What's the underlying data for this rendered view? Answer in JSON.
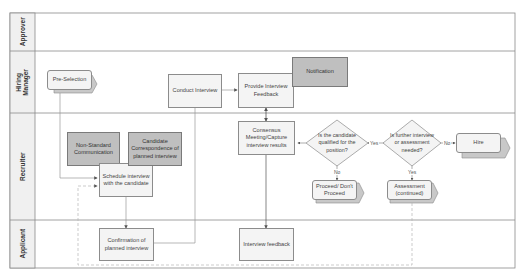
{
  "lanes": [
    {
      "id": "approver",
      "label": "Approver"
    },
    {
      "id": "hiring",
      "label": "Hiring Manager",
      "line1": "Hiring",
      "line2": "Manager"
    },
    {
      "id": "recruiter",
      "label": "Recruiter"
    },
    {
      "id": "applicant",
      "label": "Applicant"
    }
  ],
  "nodes": {
    "pre_selection": "Pre-Selection",
    "conduct_interview": "Conduct Interview",
    "provide_feedback": "Provide Interview Feedback",
    "notification": "Notification",
    "non_standard": "Non-Standard Communication",
    "candidate_corr": "Candidate Correspondence of planned interview",
    "schedule": "Schedule interview with the candidate",
    "consensus": "Consensus Meeting/Capture interview results",
    "qualified": "Is the candidate qualified for the position?",
    "further": "Is further interview or assessment needed?",
    "hire": "Hire",
    "proceed": "Proceed/ Don't Proceed",
    "assessment": "Assessment (continued)",
    "confirmation": "Confirmation of planned interview",
    "interview_feedback": "Interview feedback"
  },
  "edge_labels": {
    "q_yes": "Yes",
    "q_no": "No",
    "f_yes": "Yes",
    "f_no": "No"
  },
  "colors": {
    "lane_border": "#8a8a8a",
    "box_fill": "#f4f4f4",
    "dark_fill": "#bfbfbf",
    "connector": "#9a9a9a",
    "dashed": "#b5b5b5"
  }
}
